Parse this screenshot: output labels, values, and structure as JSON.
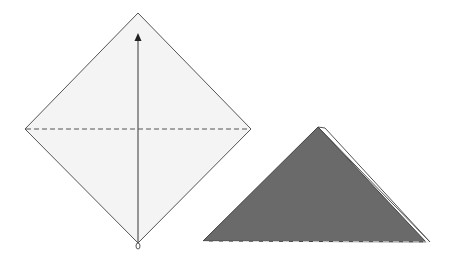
{
  "diagram": {
    "type": "origami-instruction",
    "steps": [
      {
        "id": "step-1",
        "shape": "square-paper-as-diamond",
        "paper_color": "#f4f4f4",
        "edge_color": "#555555",
        "vertices": {
          "top": [
            138,
            13
          ],
          "right": [
            251,
            129
          ],
          "bottom": [
            138,
            243
          ],
          "left": [
            25,
            129
          ]
        },
        "valley_fold_line": {
          "from": [
            25,
            129
          ],
          "to": [
            251,
            129
          ],
          "style": "dashed"
        },
        "arrow": {
          "from": [
            138,
            246
          ],
          "to": [
            138,
            34
          ],
          "direction": "up",
          "meaning": "fold bottom corner up to top"
        }
      },
      {
        "id": "step-2",
        "shape": "folded-triangle",
        "fill_color": "#6a6a6a",
        "back_layer_color": "#ffffff",
        "vertices": {
          "apex": [
            318,
            127
          ],
          "left": [
            203,
            241
          ],
          "right": [
            430,
            242
          ]
        },
        "back_layer_apex": [
          325,
          128
        ],
        "base_edge_style": "dashed"
      }
    ]
  }
}
